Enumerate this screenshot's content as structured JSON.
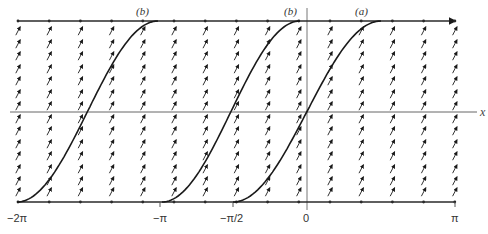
{
  "figure": {
    "type": "direction-field",
    "x_axis_label": "x",
    "tick_labels": [
      {
        "text": "−2π",
        "value": -6.2832
      },
      {
        "text": "−π",
        "value": -3.1416
      },
      {
        "text": "−π/2",
        "value": -1.5708
      },
      {
        "text": "0",
        "value": 0
      },
      {
        "text": "π",
        "value": 3.1416
      }
    ],
    "curve_labels": [
      {
        "text": "(b)",
        "curve": 0
      },
      {
        "text": "(b)",
        "curve": 1
      },
      {
        "text": "(a)",
        "curve": 2
      }
    ],
    "colors": {
      "curve": "#1a1a1a",
      "arrows": "#1a1a1a",
      "axes": "#666666",
      "boundary_lines": "#2a2a2a"
    }
  },
  "chart_data": {
    "type": "line",
    "title": "",
    "xlabel": "x",
    "ylabel": "",
    "xlim": [
      -6.2832,
      3.1416
    ],
    "x_ticks": [
      "−2π",
      "−π",
      "−π/2",
      "0",
      "π"
    ],
    "series": [
      {
        "name": "(b)",
        "start_x": -6.2832,
        "end_x": -3.56,
        "shape": "sigmoid"
      },
      {
        "name": "(b)",
        "start_x": -3.0,
        "end_x": -0.15,
        "shape": "sigmoid"
      },
      {
        "name": "(a)",
        "start_x": -1.57,
        "end_x": 1.57,
        "shape": "sigmoid"
      }
    ],
    "grid": false
  }
}
